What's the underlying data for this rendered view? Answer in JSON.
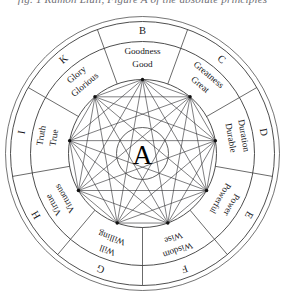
{
  "caption": "fig. 1  Ramon Llull, Figure A of the absolute principles",
  "figure": {
    "title": "Figure A",
    "center_label": "A",
    "center_name": "center-letter-a",
    "ring_count": 3,
    "sector_count": 9,
    "stroke_color": "#2f2f33",
    "background_color": "#ffffff",
    "chord_count": 36
  },
  "sectors": [
    {
      "letter": "B",
      "noun": "Goodness",
      "adjective": "Good",
      "angle": 270
    },
    {
      "letter": "C",
      "noun": "Greatness",
      "adjective": "Great",
      "angle": 310
    },
    {
      "letter": "D",
      "noun": "Duration",
      "adjective": "Durable",
      "angle": 350
    },
    {
      "letter": "E",
      "noun": "Power",
      "adjective": "Powerful",
      "angle": 30
    },
    {
      "letter": "F",
      "noun": "Wisdom",
      "adjective": "Wise",
      "angle": 70
    },
    {
      "letter": "G",
      "noun": "Will",
      "adjective": "Willing",
      "angle": 110
    },
    {
      "letter": "H",
      "noun": "Virtue",
      "adjective": "Virtuous",
      "angle": 150
    },
    {
      "letter": "I",
      "noun": "Truth",
      "adjective": "True",
      "angle": 190
    },
    {
      "letter": "K",
      "noun": "Glory",
      "adjective": "Glorious",
      "angle": 230
    }
  ]
}
